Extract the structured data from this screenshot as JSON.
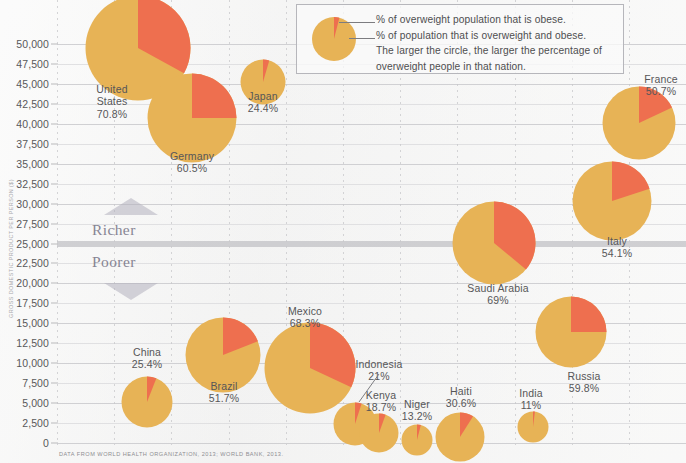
{
  "chart_data": {
    "type": "scatter",
    "title": "",
    "xlabel": "",
    "ylabel": "GROSS DOMESTIC PRODUCT PER PERSON ($)",
    "ylim": [
      0,
      50000
    ],
    "ytick_labels": [
      "50,000",
      "47,500",
      "45,000",
      "42,500",
      "40,000",
      "37,500",
      "35,000",
      "32,500",
      "30,000",
      "27,500",
      "25,000",
      "22,500",
      "20,000",
      "17,500",
      "15,000",
      "12,500",
      "10,000",
      "7,500",
      "5,000",
      "2,500",
      "0"
    ],
    "ytick_values": [
      50000,
      47500,
      45000,
      42500,
      40000,
      37500,
      35000,
      32500,
      30000,
      27500,
      25000,
      22500,
      20000,
      17500,
      15000,
      12500,
      10000,
      7500,
      5000,
      2500,
      0
    ],
    "grid": "horizontal solid, vertical dotted; 25,000 line emphasized",
    "legend_position": "top-right",
    "bubble_meaning": "circle area = percentage of overweight people in that nation",
    "slice_meaning": "red wedge = % of overweight population that is obese",
    "colors": {
      "overweight": "#e7b356",
      "obese": "#ee6f4f",
      "grid": "#c9c9cc",
      "band": "#c2c2c6",
      "text": "#565658",
      "background": "#f4f4f3"
    },
    "points": [
      {
        "name": "United States",
        "pct_label": "70.8%",
        "overweight_pct": 70.8,
        "obese_share_pct": 33.0,
        "gdp": 51200,
        "cx": 138,
        "cy": 48,
        "r": 53,
        "label_x": 112,
        "label_y": 83,
        "label": "United\nStates\n70.8%"
      },
      {
        "name": "Germany",
        "pct_label": "60.5%",
        "overweight_pct": 60.5,
        "obese_share_pct": 25.0,
        "gdp": 42800,
        "cx": 192,
        "cy": 118,
        "r": 45,
        "label_x": 192,
        "label_y": 150,
        "label": "Germany\n60.5%"
      },
      {
        "name": "Japan",
        "pct_label": "24.4%",
        "overweight_pct": 24.4,
        "obese_share_pct": 4.5,
        "gdp": 46700,
        "cx": 263,
        "cy": 82,
        "r": 23,
        "label_x": 263,
        "label_y": 90,
        "label": "Japan\n24.4%"
      },
      {
        "name": "France",
        "pct_label": "50.7%",
        "overweight_pct": 50.7,
        "obese_share_pct": 18.0,
        "gdp": 40400,
        "cx": 639,
        "cy": 123,
        "r": 37,
        "label_x": 661,
        "label_y": 73,
        "label": "France\n50.7%"
      },
      {
        "name": "Italy",
        "pct_label": "54.1%",
        "overweight_pct": 54.1,
        "obese_share_pct": 20.0,
        "gdp": 31000,
        "cx": 612,
        "cy": 201,
        "r": 40,
        "label_x": 617,
        "label_y": 235,
        "label": "Italy\n54.1%"
      },
      {
        "name": "Saudi Arabia",
        "pct_label": "69%",
        "overweight_pct": 69.0,
        "obese_share_pct": 36.0,
        "gdp": 25000,
        "cx": 494,
        "cy": 243,
        "r": 42,
        "label_x": 498,
        "label_y": 282,
        "label": "Saudi Arabia\n69%"
      },
      {
        "name": "Russia",
        "pct_label": "59.8%",
        "overweight_pct": 59.8,
        "obese_share_pct": 25.0,
        "gdp": 14500,
        "cx": 571,
        "cy": 332,
        "r": 36,
        "label_x": 584,
        "label_y": 370,
        "label": "Russia\n59.8%"
      },
      {
        "name": "Mexico",
        "pct_label": "68.3%",
        "overweight_pct": 68.3,
        "obese_share_pct": 32.0,
        "gdp": 9800,
        "cx": 310,
        "cy": 368,
        "r": 46,
        "label_x": 305,
        "label_y": 305,
        "label": "Mexico\n68.3%"
      },
      {
        "name": "Brazil",
        "pct_label": "51.7%",
        "overweight_pct": 51.7,
        "obese_share_pct": 19.0,
        "gdp": 11300,
        "cx": 223,
        "cy": 355,
        "r": 38,
        "label_x": 224,
        "label_y": 380,
        "label": "Brazil\n51.7%"
      },
      {
        "name": "China",
        "pct_label": "25.4%",
        "overweight_pct": 25.4,
        "obese_share_pct": 6.0,
        "gdp": 6800,
        "cx": 147,
        "cy": 402,
        "r": 26,
        "label_x": 147,
        "label_y": 346,
        "label": "China\n25.4%"
      },
      {
        "name": "Indonesia",
        "pct_label": "21%",
        "overweight_pct": 21.0,
        "obese_share_pct": 5.0,
        "gdp": 3500,
        "cx": 355,
        "cy": 424,
        "r": 22,
        "label_x": 379,
        "label_y": 358,
        "label": "Indonesia\n21%"
      },
      {
        "name": "Kenya",
        "pct_label": "18.7%",
        "overweight_pct": 18.7,
        "obese_share_pct": 5.5,
        "gdp": 1100,
        "cx": 379,
        "cy": 433,
        "r": 20,
        "label_x": 381,
        "label_y": 389,
        "label": "Kenya\n18.7%"
      },
      {
        "name": "Niger",
        "pct_label": "13.2%",
        "overweight_pct": 13.2,
        "obese_share_pct": 4.0,
        "gdp": 400,
        "cx": 417,
        "cy": 440,
        "r": 16,
        "label_x": 417,
        "label_y": 398,
        "label": "Niger\n13.2%"
      },
      {
        "name": "Haiti",
        "pct_label": "30.6%",
        "overweight_pct": 30.6,
        "obese_share_pct": 9.0,
        "gdp": 800,
        "cx": 460,
        "cy": 437,
        "r": 25,
        "label_x": 461,
        "label_y": 385,
        "label": "Haiti\n30.6%"
      },
      {
        "name": "India",
        "pct_label": "11%",
        "overweight_pct": 11.0,
        "obese_share_pct": 2.0,
        "gdp": 1500,
        "cx": 533,
        "cy": 427,
        "r": 16,
        "label_x": 531,
        "label_y": 387,
        "label": "India\n11%"
      }
    ]
  },
  "legend": {
    "lines": [
      "% of overweight population that is obese.",
      "% of population that is overweight and obese.",
      "The larger the circle, the larger the percentage of",
      "overweight people in that nation."
    ]
  },
  "annotations": {
    "richer": "Richer",
    "poorer": "Poorer"
  },
  "source": "DATA FROM WORLD HEALTH ORGANIZATION, 2013; WORLD BANK, 2013."
}
